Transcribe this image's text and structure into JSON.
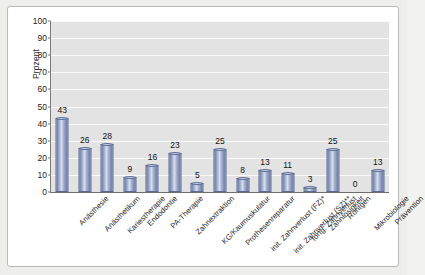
{
  "chart_data": {
    "type": "bar",
    "title": "",
    "xlabel": "",
    "ylabel": "Prozent",
    "ylim": [
      0,
      100
    ],
    "ytick_step": 10,
    "ytick_labels": [
      "0",
      "10",
      "20",
      "30",
      "40",
      "50",
      "60",
      "70",
      "80",
      "90",
      "100"
    ],
    "grid": true,
    "legend": "none",
    "bar_color": "#8d9cc0",
    "plot_background": "#e3e3e3",
    "gridline_color": "#fbfbfb",
    "categories": [
      "Anästhesie",
      "Anästhetikum",
      "Kariestherapie",
      "Endodontie",
      "PA-Therapie",
      "Zahnextraktion",
      "KG/Kaumuskulatur",
      "Prothesenreparatur",
      "init. Zahnverlust (FZ)*",
      "init. Zahnverlust (SZ)**",
      "fortg. Zahnverlust",
      "Zahnlosigkeit",
      "Röntgen",
      "Mikrobiologie",
      "Prävention"
    ],
    "values": [
      43,
      26,
      28,
      9,
      16,
      23,
      5,
      25,
      8,
      13,
      11,
      3,
      25,
      0,
      13
    ],
    "data_labels": [
      "43",
      "26",
      "28",
      "9",
      "16",
      "23",
      "5",
      "25",
      "8",
      "13",
      "11",
      "3",
      "25",
      "0",
      "13"
    ]
  }
}
